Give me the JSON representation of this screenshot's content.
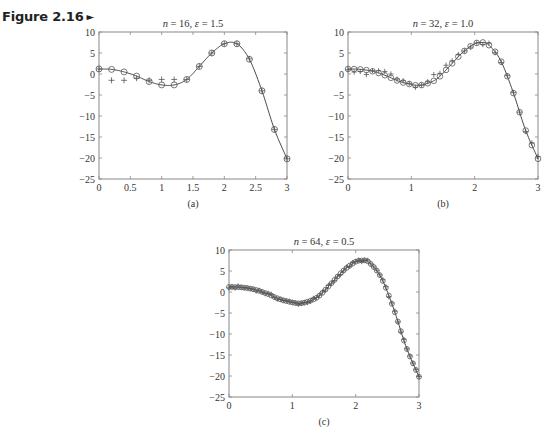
{
  "figure": {
    "label": "Figure 2.16",
    "arrow": "►"
  },
  "chart_data": [
    {
      "id": "a",
      "type": "line",
      "title": "n = 16, ε = 1.5",
      "title_parts": {
        "n": "16",
        "eps": "1.5"
      },
      "caption": "(a)",
      "xlabel": "",
      "ylabel": "",
      "xlim": [
        0,
        3
      ],
      "ylim": [
        -25,
        10
      ],
      "xticks": [
        0,
        0.5,
        1,
        1.5,
        2,
        2.5,
        3
      ],
      "xtick_labels": [
        "0",
        "0.5",
        "1",
        "1.5",
        "2",
        "2.5",
        "3"
      ],
      "yticks": [
        10,
        5,
        0,
        -5,
        -10,
        -15,
        -20,
        -25
      ],
      "ytick_labels": [
        "10",
        "5",
        "0",
        "−5",
        "−10",
        "−15",
        "−20",
        "−25"
      ],
      "grid": false,
      "series": [
        {
          "name": "smoothed fit (circles, solid line)",
          "marker": "o",
          "x": [
            0,
            0.2,
            0.4,
            0.6,
            0.8,
            1.0,
            1.2,
            1.4,
            1.6,
            1.8,
            2.0,
            2.2,
            2.4,
            2.6,
            2.8,
            3.0
          ],
          "y": [
            1.2,
            1.1,
            0.5,
            -0.5,
            -1.8,
            -2.6,
            -2.6,
            -1.3,
            1.8,
            5.0,
            7.2,
            7.2,
            3.5,
            -4.0,
            -13.2,
            -20.2
          ]
        },
        {
          "name": "data (plus markers)",
          "marker": "+",
          "x": [
            0,
            0.2,
            0.4,
            0.6,
            0.8,
            1.0,
            1.2,
            1.4,
            1.6,
            1.8,
            2.0,
            2.2,
            2.4,
            2.6,
            2.8,
            3.0
          ],
          "y": [
            1.2,
            -1.5,
            -1.5,
            -1.0,
            -1.5,
            -1.3,
            -1.3,
            -1.3,
            1.8,
            5.0,
            7.2,
            7.2,
            3.6,
            -4.0,
            -13.2,
            -20.2
          ]
        }
      ]
    },
    {
      "id": "b",
      "type": "line",
      "title": "n = 32, ε = 1.0",
      "title_parts": {
        "n": "32",
        "eps": "1.0"
      },
      "caption": "(b)",
      "xlabel": "",
      "ylabel": "",
      "xlim": [
        0,
        3
      ],
      "ylim": [
        -25,
        10
      ],
      "xticks": [
        0,
        1,
        2,
        3
      ],
      "xtick_labels": [
        "0",
        "1",
        "2",
        "3"
      ],
      "yticks": [
        10,
        5,
        0,
        -5,
        -10,
        -15,
        -20,
        -25
      ],
      "ytick_labels": [
        "10",
        "5",
        "0",
        "−5",
        "−10",
        "−15",
        "−20",
        "−25"
      ],
      "grid": false,
      "series": [
        {
          "name": "smoothed fit (circles, solid line)",
          "marker": "o",
          "n": 32
        },
        {
          "name": "data (plus markers)",
          "marker": "+",
          "n": 32,
          "noise_note": "plus markers deviate slightly from the curve near x = 0.1-0.7 and x = 1.3-1.8"
        }
      ]
    },
    {
      "id": "c",
      "type": "line",
      "title": "n = 64, ε = 0.5",
      "title_parts": {
        "n": "64",
        "eps": "0.5"
      },
      "caption": "(c)",
      "xlabel": "",
      "ylabel": "",
      "xlim": [
        0,
        3
      ],
      "ylim": [
        -25,
        10
      ],
      "xticks": [
        0,
        1,
        2,
        3
      ],
      "xtick_labels": [
        "0",
        "1",
        "2",
        "3"
      ],
      "yticks": [
        10,
        5,
        0,
        -5,
        -10,
        -15,
        -20,
        -25
      ],
      "ytick_labels": [
        "10",
        "5",
        "0",
        "−5",
        "−10",
        "−15",
        "−20",
        "−25"
      ],
      "grid": false,
      "series": [
        {
          "name": "smoothed fit (circles, solid line)",
          "marker": "o",
          "n": 64
        },
        {
          "name": "data (plus markers)",
          "marker": "+",
          "n": 64
        }
      ]
    }
  ],
  "curve_profile": {
    "note": "underlying smooth function sampled for panels b and c (approx.)",
    "x": [
      0,
      0.2,
      0.4,
      0.6,
      0.8,
      1.0,
      1.1,
      1.2,
      1.4,
      1.6,
      1.8,
      2.0,
      2.1,
      2.2,
      2.4,
      2.6,
      2.8,
      3.0
    ],
    "y": [
      1.2,
      1.1,
      0.6,
      -0.4,
      -1.7,
      -2.5,
      -2.7,
      -2.5,
      -1.2,
      1.8,
      5.0,
      7.2,
      7.5,
      7.2,
      3.5,
      -4.0,
      -13.2,
      -20.2
    ]
  }
}
